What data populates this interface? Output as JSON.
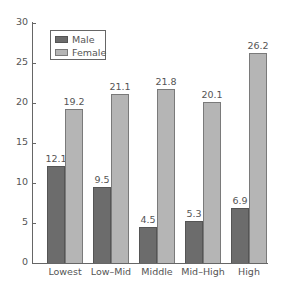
{
  "chart_data": {
    "type": "bar",
    "title": "",
    "xlabel": "",
    "ylabel": "",
    "categories": [
      "Lowest",
      "Low–Mid",
      "Middle",
      "Mid–High",
      "High"
    ],
    "series": [
      {
        "name": "Male",
        "values": [
          12.1,
          9.5,
          4.5,
          5.3,
          6.9
        ],
        "color": "#6c6c6c"
      },
      {
        "name": "Female",
        "values": [
          19.2,
          21.1,
          21.8,
          20.1,
          26.2
        ],
        "color": "#b5b5b5"
      }
    ],
    "value_labels": {
      "male": [
        "12.1",
        "9.5",
        "4.5",
        "5.3",
        "6.9"
      ],
      "female": [
        "19.2",
        "21.1",
        "21.8",
        "20.1",
        "26.2"
      ]
    },
    "ylim": [
      0,
      30
    ],
    "yticks": [
      "0",
      "5",
      "10",
      "15",
      "20",
      "25",
      "30"
    ],
    "grid": false,
    "legend": {
      "position": "upper-left-inside",
      "entries": [
        "Male",
        "Female"
      ]
    }
  }
}
